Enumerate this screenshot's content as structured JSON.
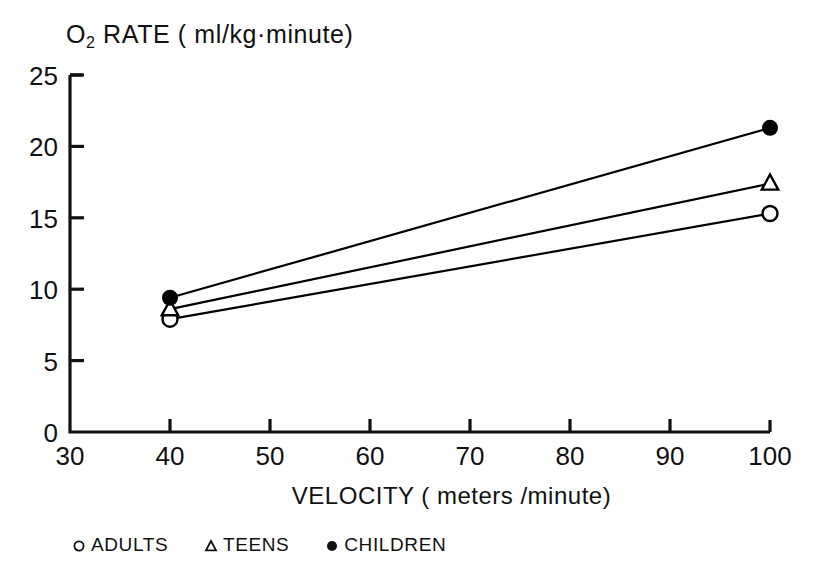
{
  "chart_data": {
    "type": "line",
    "title": "O2 RATE ( ml/kg·minute)",
    "title_main": "O",
    "title_sub": "2",
    "title_rest": " RATE ( ml/kg·minute)",
    "xlabel": "VELOCITY ( meters /minute)",
    "ylabel": "",
    "x": [
      40,
      100
    ],
    "xlim": [
      30,
      100
    ],
    "ylim": [
      0,
      25
    ],
    "xticks": [
      "30",
      "40",
      "50",
      "60",
      "70",
      "80",
      "90",
      "100"
    ],
    "xtick_values": [
      30,
      40,
      50,
      60,
      70,
      80,
      90,
      100
    ],
    "yticks": [
      "0",
      "5",
      "10",
      "15",
      "20",
      "25"
    ],
    "ytick_values": [
      0,
      5,
      10,
      15,
      20,
      25
    ],
    "grid": false,
    "legend_position": "below-plot",
    "series": [
      {
        "name": "ADULTS",
        "marker": "open-circle",
        "values": [
          7.9,
          15.3
        ],
        "color": "#000000"
      },
      {
        "name": "TEENS",
        "marker": "open-triangle",
        "values": [
          8.6,
          17.4
        ],
        "color": "#000000"
      },
      {
        "name": "CHILDREN",
        "marker": "filled-circle",
        "values": [
          9.4,
          21.3
        ],
        "color": "#000000"
      }
    ]
  },
  "legend": {
    "items": [
      {
        "marker_name": "open-circle-marker-icon",
        "label": "ADULTS"
      },
      {
        "marker_name": "open-triangle-marker-icon",
        "label": "TEENS"
      },
      {
        "marker_name": "filled-circle-marker-icon",
        "label": "CHILDREN"
      }
    ]
  },
  "axis": {
    "x_ticks": [
      "30",
      "40",
      "50",
      "60",
      "70",
      "80",
      "90",
      "100"
    ],
    "y_ticks": [
      "25",
      "20",
      "15",
      "10",
      "5",
      "0"
    ]
  }
}
